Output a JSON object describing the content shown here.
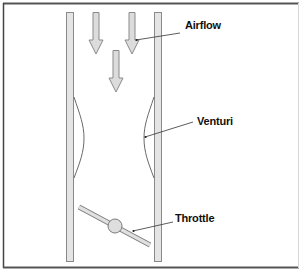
{
  "diagram": {
    "labels": {
      "airflow": "Airflow",
      "venturi": "Venturi",
      "throttle": "Throttle"
    },
    "colors": {
      "frame": "#555555",
      "pipe_fill": "#e4e4e4",
      "pipe_stroke": "#8a8a8a",
      "arrow_fill": "#dcdcdc",
      "arrow_stroke": "#8a8a8a",
      "curve_stroke": "#6a6a6a",
      "leader_line": "#333333",
      "throttle_fill": "#e0e0e0",
      "throttle_stroke": "#7a7a7a"
    }
  }
}
